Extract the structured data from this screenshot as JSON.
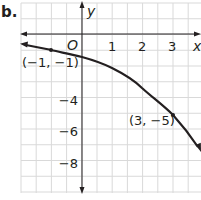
{
  "part_label": "b.",
  "chart_data": {
    "type": "line",
    "title": "",
    "xlabel": "x",
    "ylabel": "y",
    "origin_label": "O",
    "x_tick_labels": [
      "1",
      "2",
      "3"
    ],
    "y_tick_labels": [
      "−4",
      "−6",
      "−8"
    ],
    "xlim": [
      -2,
      3.9
    ],
    "ylim": [
      -10,
      2
    ],
    "grid": true,
    "grid_x_step": 0.5,
    "grid_y_step": 1,
    "series": [
      {
        "name": "curve",
        "x": [
          -2,
          -1,
          0,
          1,
          2,
          3,
          3.9
        ],
        "y": [
          -0.6,
          -1,
          -1.5,
          -2.2,
          -3.4,
          -5,
          -7.3
        ],
        "arrow_start": true,
        "arrow_end": true
      }
    ],
    "annotations": [
      {
        "text": "(−1, −1)",
        "x": -1,
        "y": -1
      },
      {
        "text": "(3, −5)",
        "x": 3,
        "y": -5
      }
    ]
  },
  "colors": {
    "grid": "#d9d9d9",
    "axis": "#231f20",
    "curve": "#231f20"
  }
}
